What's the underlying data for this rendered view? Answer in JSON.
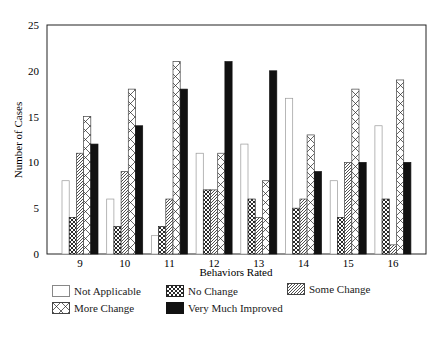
{
  "chart_data": {
    "type": "bar",
    "title": "",
    "xlabel": "Behaviors Rated",
    "ylabel": "Number of Cases",
    "ylim": [
      0,
      25
    ],
    "yticks": [
      0,
      5,
      10,
      15,
      20,
      25
    ],
    "grid": false,
    "legend_position": "bottom",
    "categories": [
      "9",
      "10",
      "11",
      "12",
      "13",
      "14",
      "15",
      "16"
    ],
    "series": [
      {
        "name": "Not Applicable",
        "pattern": "white",
        "values": [
          8,
          6,
          2,
          11,
          12,
          17,
          8,
          14
        ]
      },
      {
        "name": "No Change",
        "pattern": "crosshatch-dense",
        "values": [
          4,
          3,
          3,
          7,
          6,
          5,
          4,
          6
        ]
      },
      {
        "name": "Some Change",
        "pattern": "diagonal",
        "values": [
          11,
          9,
          6,
          7,
          4,
          6,
          10,
          1
        ]
      },
      {
        "name": "More Change",
        "pattern": "crosshatch-open",
        "values": [
          15,
          18,
          21,
          11,
          8,
          13,
          18,
          19
        ]
      },
      {
        "name": "Very Much Improved",
        "pattern": "black",
        "values": [
          12,
          14,
          18,
          21,
          20,
          9,
          10,
          10
        ]
      }
    ]
  },
  "legend": {
    "items": [
      {
        "label": "Not Applicable"
      },
      {
        "label": "No Change"
      },
      {
        "label": "Some Change"
      },
      {
        "label": "More Change"
      },
      {
        "label": "Very Much Improved"
      }
    ]
  }
}
